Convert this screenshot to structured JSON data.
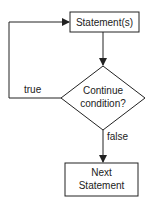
{
  "diagram": {
    "type": "flowchart",
    "nodes": [
      {
        "id": "statements",
        "shape": "rectangle",
        "label": "Statement(s)"
      },
      {
        "id": "condition",
        "shape": "diamond",
        "label_line1": "Continue",
        "label_line2": "condition?"
      },
      {
        "id": "next",
        "shape": "rectangle",
        "label_line1": "Next",
        "label_line2": "Statement"
      }
    ],
    "edges": [
      {
        "from": "statements",
        "to": "condition",
        "label": ""
      },
      {
        "from": "condition",
        "to": "statements",
        "label": "true"
      },
      {
        "from": "condition",
        "to": "next",
        "label": "false"
      }
    ],
    "colors": {
      "stroke": "#222222",
      "background": "#ffffff",
      "text": "#222222"
    }
  }
}
